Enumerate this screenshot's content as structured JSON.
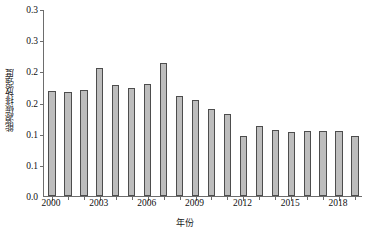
{
  "chart_data": {
    "type": "bar",
    "title": "",
    "xlabel": "年份",
    "ylabel": "能源碳排放强度",
    "ylim": [
      0,
      0.3
    ],
    "grid": false,
    "legend": null,
    "y_ticks": [
      {
        "value": 0.3,
        "label": "0.3"
      },
      {
        "value": 0.25,
        "label": "0.3"
      },
      {
        "value": 0.2,
        "label": "0.2"
      },
      {
        "value": 0.15,
        "label": "0.2"
      },
      {
        "value": 0.1,
        "label": "0.1"
      },
      {
        "value": 0.05,
        "label": "0.1"
      },
      {
        "value": 0.0,
        "label": "0.0"
      }
    ],
    "x_tick_labels": [
      "2000",
      "2003",
      "2006",
      "2009",
      "2012",
      "2015",
      "2018"
    ],
    "categories": [
      "2000",
      "2001",
      "2002",
      "2003",
      "2004",
      "2005",
      "2006",
      "2007",
      "2008",
      "2009",
      "2010",
      "2011",
      "2012",
      "2013",
      "2014",
      "2015",
      "2016",
      "2017",
      "2018",
      "2019"
    ],
    "values": [
      0.168,
      0.167,
      0.17,
      0.206,
      0.178,
      0.173,
      0.179,
      0.213,
      0.16,
      0.154,
      0.14,
      0.131,
      0.096,
      0.112,
      0.106,
      0.102,
      0.104,
      0.105,
      0.104,
      0.096
    ],
    "bar_color": "#bdbdbd",
    "bar_edge_color": "#4d4d4d",
    "axis_color": "#6d6d6d"
  }
}
